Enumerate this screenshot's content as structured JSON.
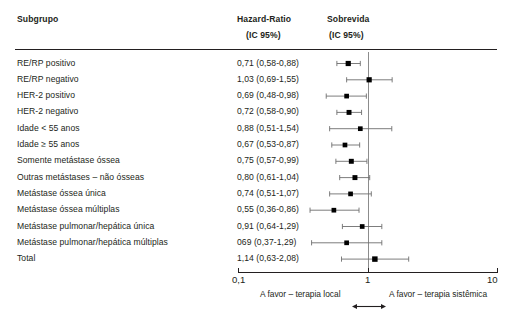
{
  "header": {
    "col_subgroup": "Subgrupo",
    "col_hr_line1": "Hazard-Ratio",
    "col_hr_line2": "(IC 95%)",
    "col_surv_line1": "Sobrevida",
    "col_surv_line2": "(IC 95%)"
  },
  "axis": {
    "tick_left": "0,1",
    "tick_mid": "1",
    "tick_right": "10",
    "note_left": "A favor – terapia local",
    "note_right": "A favor – terapia sistêmica"
  },
  "chart_data": {
    "type": "forest",
    "title": "",
    "xlabel": "Hazard-Ratio (IC 95%)",
    "ylabel": "Subgrupo",
    "xlim": [
      0.1,
      10
    ],
    "xscale": "log",
    "xticks": [
      0.1,
      1,
      10
    ],
    "xticklabels": [
      "0,1",
      "1",
      "10"
    ],
    "reference_line": 1,
    "grid": false,
    "legend": null,
    "categories": [
      "RE/RP positivo",
      "RE/RP negativo",
      "HER-2 positivo",
      "HER-2 negativo",
      "Idade < 55 anos",
      "Idade ≥ 55 anos",
      "Somente metástase óssea",
      "Outras metástases – não ósseas",
      "Metástase óssea única",
      "Metástase óssea múltiplas",
      "Metástase pulmonar/hepática única",
      "Metástase pulmonar/hepática múltiplas",
      "Total"
    ],
    "rows": [
      {
        "label": "RE/RP positivo",
        "text": "0,71 (0,58-0,88)",
        "hr": 0.71,
        "lo": 0.58,
        "hi": 0.88,
        "size": 1.0
      },
      {
        "label": "RE/RP negativo",
        "text": "1,03 (0,69-1,55)",
        "hr": 1.03,
        "lo": 0.69,
        "hi": 1.55,
        "size": 1.0
      },
      {
        "label": "HER-2 positivo",
        "text": "0,69 (0,48-0,98)",
        "hr": 0.69,
        "lo": 0.48,
        "hi": 0.98,
        "size": 0.9
      },
      {
        "label": "HER-2 negativo",
        "text": "0,72 (0,58-0,90)",
        "hr": 0.72,
        "lo": 0.58,
        "hi": 0.9,
        "size": 0.95
      },
      {
        "label": "Idade < 55 anos",
        "text": "0,88 (0,51-1,54)",
        "hr": 0.88,
        "lo": 0.51,
        "hi": 1.54,
        "size": 0.9
      },
      {
        "label": "Idade ≥ 55 anos",
        "text": "0,67 (0,53-0,87)",
        "hr": 0.67,
        "lo": 0.53,
        "hi": 0.87,
        "size": 0.9
      },
      {
        "label": "Somente metástase óssea",
        "text": "0,75 (0,57-0,99)",
        "hr": 0.75,
        "lo": 0.57,
        "hi": 0.99,
        "size": 0.95
      },
      {
        "label": "Outras metástases – não ósseas",
        "text": "0,80 (0,61-1,04)",
        "hr": 0.8,
        "lo": 0.61,
        "hi": 1.04,
        "size": 0.95
      },
      {
        "label": "Metástase óssea única",
        "text": "0,74 (0,51-1,07)",
        "hr": 0.74,
        "lo": 0.51,
        "hi": 1.07,
        "size": 0.9
      },
      {
        "label": "Metástase óssea múltiplas",
        "text": "0,55 (0,36-0,86)",
        "hr": 0.55,
        "lo": 0.36,
        "hi": 0.86,
        "size": 0.9
      },
      {
        "label": "Metástase pulmonar/hepática única",
        "text": "0,91 (0,64-1,29)",
        "hr": 0.91,
        "lo": 0.64,
        "hi": 1.29,
        "size": 0.9
      },
      {
        "label": "Metástase pulmonar/hepática múltiplas",
        "text": "069 (0,37-1,29)",
        "hr": 0.69,
        "lo": 0.37,
        "hi": 1.29,
        "size": 0.9
      },
      {
        "label": "Total",
        "text": "1,14 (0,63-2,08)",
        "hr": 1.14,
        "lo": 0.63,
        "hi": 2.08,
        "size": 1.05
      }
    ]
  },
  "style": {
    "marker_color": "#000000",
    "whisker_color": "#6e6e6e",
    "reference_line_color": "#8c8c8c",
    "text_color": "#231f20",
    "rule_color": "#231f20"
  }
}
